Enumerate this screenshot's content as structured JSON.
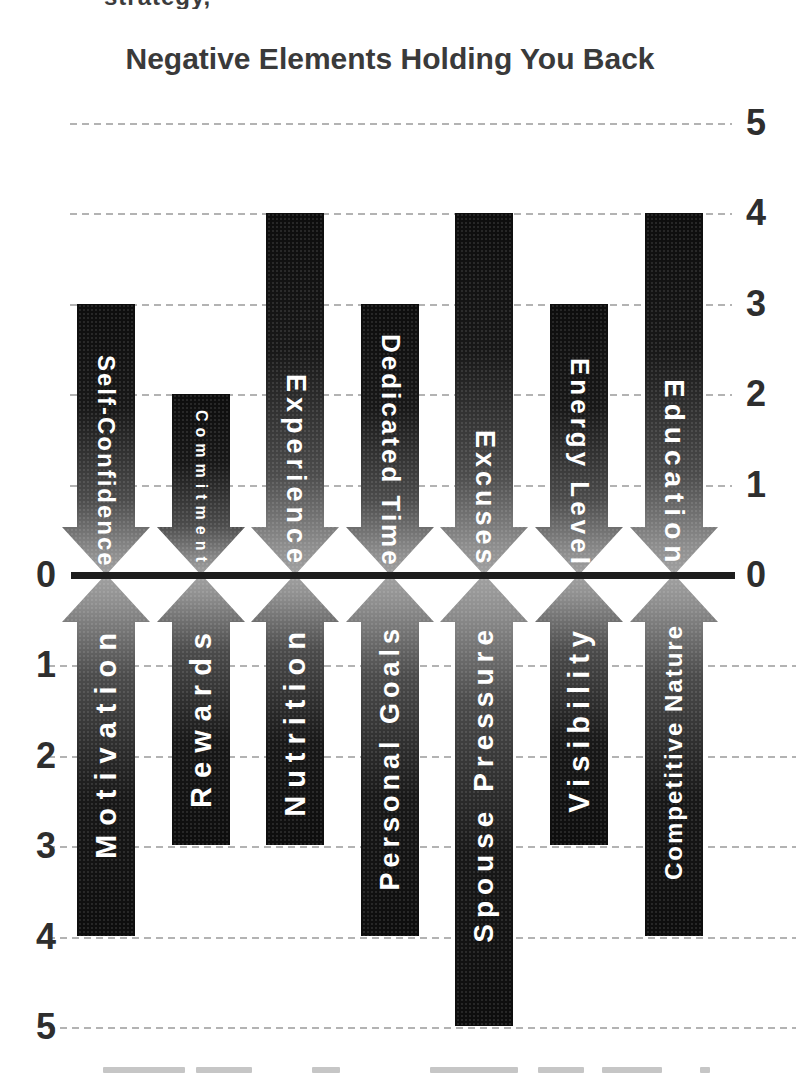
{
  "page": {
    "cropped_text_top": "strategy,"
  },
  "chart_data": {
    "type": "bar",
    "subtype": "diverging-vertical-arrows",
    "title": "Negative Elements Holding You Back",
    "axis": {
      "min": 0,
      "max": 5,
      "step": 1,
      "right_labels_top_to_zero": [
        "5",
        "4",
        "3",
        "2",
        "1",
        "0"
      ],
      "left_labels_zero_to_bottom": [
        "0",
        "1",
        "2",
        "3",
        "4",
        "5"
      ],
      "gridline_style": "dashed",
      "zero_line": true,
      "legend": "none"
    },
    "series": [
      {
        "name": "negative-elements",
        "direction": "down",
        "points": [
          {
            "label": "Self-Confidence",
            "value": 3
          },
          {
            "label": "Commitment",
            "value": 2
          },
          {
            "label": "Experience",
            "value": 4
          },
          {
            "label": "Dedicated Time",
            "value": 3
          },
          {
            "label": "Excuses",
            "value": 4
          },
          {
            "label": "Energy Level",
            "value": 3
          },
          {
            "label": "Education",
            "value": 4
          }
        ]
      },
      {
        "name": "positive-elements",
        "direction": "up",
        "points": [
          {
            "label": "Motivation",
            "value": 4
          },
          {
            "label": "Rewards",
            "value": 3
          },
          {
            "label": "Nutrition",
            "value": 3
          },
          {
            "label": "Personal Goals",
            "value": 4
          },
          {
            "label": "Spouse Pressure",
            "value": 5
          },
          {
            "label": "Visibility",
            "value": 3
          },
          {
            "label": "Competitive Nature",
            "value": 4
          }
        ]
      }
    ],
    "colors": {
      "arrow_dark": "#121212",
      "arrow_tip": "#a2a2a2",
      "arrow_text": "#ffffff",
      "gridline": "#b3b3b3",
      "zero_line": "#1d1d1d",
      "axis_text": "#2e2e2e",
      "title_text": "#3a3a3a",
      "background": "#ffffff"
    }
  }
}
